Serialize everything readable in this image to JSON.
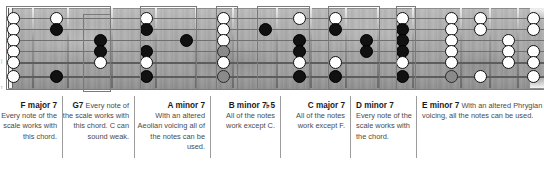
{
  "diagram": {
    "instrument": "6-string guitar neck",
    "string_count": 6,
    "colors": {
      "dot_black": "#111111",
      "dot_white": "#ffffff",
      "dot_gray": "#8a8a8a",
      "box_stroke": "#7a7a7a",
      "caption_text": "#4a4a4a",
      "chord_label": "#1a1a1a",
      "fretboard": "#a8a8a8"
    }
  },
  "fretboard": {
    "strings": [
      {
        "index": 1,
        "name": "high-e-string"
      },
      {
        "index": 2,
        "name": "b-string"
      },
      {
        "index": 3,
        "name": "g-string"
      },
      {
        "index": 4,
        "name": "d-string"
      },
      {
        "index": 5,
        "name": "a-string"
      },
      {
        "index": 6,
        "name": "low-e-string"
      }
    ],
    "open_string_markers": 6,
    "notes": [
      {
        "x": 13,
        "string": 1,
        "fill": "white"
      },
      {
        "x": 13,
        "string": 2,
        "fill": "white"
      },
      {
        "x": 13,
        "string": 3,
        "fill": "white"
      },
      {
        "x": 13,
        "string": 4,
        "fill": "white"
      },
      {
        "x": 13,
        "string": 5,
        "fill": "white"
      },
      {
        "x": 13,
        "string": 6,
        "fill": "white"
      },
      {
        "x": 56,
        "string": 1,
        "fill": "white"
      },
      {
        "x": 56,
        "string": 2,
        "fill": "black"
      },
      {
        "x": 56,
        "string": 6,
        "fill": "black"
      },
      {
        "x": 100,
        "string": 3,
        "fill": "black"
      },
      {
        "x": 100,
        "string": 4,
        "fill": "black"
      },
      {
        "x": 100,
        "string": 5,
        "fill": "white"
      },
      {
        "x": 146,
        "string": 1,
        "fill": "white"
      },
      {
        "x": 146,
        "string": 2,
        "fill": "black"
      },
      {
        "x": 146,
        "string": 4,
        "fill": "black"
      },
      {
        "x": 146,
        "string": 5,
        "fill": "white"
      },
      {
        "x": 146,
        "string": 6,
        "fill": "black"
      },
      {
        "x": 186,
        "string": 3,
        "fill": "black"
      },
      {
        "x": 223,
        "string": 1,
        "fill": "white"
      },
      {
        "x": 223,
        "string": 2,
        "fill": "white"
      },
      {
        "x": 223,
        "string": 3,
        "fill": "white"
      },
      {
        "x": 223,
        "string": 4,
        "fill": "gray"
      },
      {
        "x": 223,
        "string": 5,
        "fill": "white"
      },
      {
        "x": 223,
        "string": 6,
        "fill": "gray"
      },
      {
        "x": 265,
        "string": 2,
        "fill": "black"
      },
      {
        "x": 299,
        "string": 1,
        "fill": "white"
      },
      {
        "x": 299,
        "string": 3,
        "fill": "black"
      },
      {
        "x": 299,
        "string": 4,
        "fill": "black"
      },
      {
        "x": 299,
        "string": 5,
        "fill": "white"
      },
      {
        "x": 299,
        "string": 6,
        "fill": "black"
      },
      {
        "x": 335,
        "string": 1,
        "fill": "white"
      },
      {
        "x": 335,
        "string": 2,
        "fill": "black"
      },
      {
        "x": 335,
        "string": 5,
        "fill": "white"
      },
      {
        "x": 335,
        "string": 6,
        "fill": "black"
      },
      {
        "x": 366,
        "string": 3,
        "fill": "black"
      },
      {
        "x": 366,
        "string": 4,
        "fill": "black"
      },
      {
        "x": 402,
        "string": 1,
        "fill": "white"
      },
      {
        "x": 402,
        "string": 2,
        "fill": "black"
      },
      {
        "x": 402,
        "string": 3,
        "fill": "black"
      },
      {
        "x": 402,
        "string": 4,
        "fill": "black"
      },
      {
        "x": 402,
        "string": 5,
        "fill": "white"
      },
      {
        "x": 402,
        "string": 6,
        "fill": "black"
      },
      {
        "x": 451,
        "string": 1,
        "fill": "white"
      },
      {
        "x": 451,
        "string": 2,
        "fill": "white"
      },
      {
        "x": 451,
        "string": 3,
        "fill": "white"
      },
      {
        "x": 451,
        "string": 4,
        "fill": "white"
      },
      {
        "x": 451,
        "string": 5,
        "fill": "white"
      },
      {
        "x": 451,
        "string": 6,
        "fill": "gray"
      },
      {
        "x": 480,
        "string": 1,
        "fill": "white"
      },
      {
        "x": 480,
        "string": 2,
        "fill": "white"
      },
      {
        "x": 480,
        "string": 6,
        "fill": "white"
      },
      {
        "x": 508,
        "string": 3,
        "fill": "white"
      },
      {
        "x": 508,
        "string": 4,
        "fill": "white"
      },
      {
        "x": 508,
        "string": 5,
        "fill": "white"
      },
      {
        "x": 533,
        "string": 1,
        "fill": "white"
      },
      {
        "x": 533,
        "string": 2,
        "fill": "white"
      },
      {
        "x": 533,
        "string": 4,
        "fill": "white"
      },
      {
        "x": 533,
        "string": 5,
        "fill": "white"
      },
      {
        "x": 533,
        "string": 6,
        "fill": "white"
      }
    ],
    "frets": [
      8,
      32,
      67,
      111,
      155,
      195,
      232,
      276,
      310,
      345,
      377,
      412,
      460,
      489,
      517
    ],
    "voicing_boxes": [
      {
        "label": "F major 7",
        "left": 6,
        "top": 6,
        "width": 105,
        "height": 84
      },
      {
        "label": "G7",
        "left": 83,
        "top": 14,
        "width": 28,
        "height": 78
      },
      {
        "label": "A minor 7",
        "left": 140,
        "top": 6,
        "width": 57,
        "height": 84
      },
      {
        "label": "B minor 7b5",
        "left": 216,
        "top": 6,
        "width": 22,
        "height": 84
      },
      {
        "label": "C major 7",
        "left": 257,
        "top": 6,
        "width": 53,
        "height": 84
      },
      {
        "label": "D minor 7",
        "left": 328,
        "top": 6,
        "width": 52,
        "height": 84
      },
      {
        "label": "E minor 7",
        "left": 396,
        "top": 6,
        "width": 20,
        "height": 84
      }
    ]
  },
  "captions": [
    {
      "id": "f-major-7",
      "chord": "F major 7",
      "text": "Every note of the scale works with this chord.",
      "align": "right",
      "left": 0,
      "width": 62,
      "inline_chord": false
    },
    {
      "id": "g7",
      "chord": "G7",
      "text": "Every note of the scale works with this chord. C can sound weak.",
      "align": "right",
      "left": 62,
      "width": 72,
      "inline_chord": true
    },
    {
      "id": "a-minor-7",
      "chord": "A minor 7",
      "text": "With an altered Aeolian voicing all of the notes can be used.",
      "align": "right",
      "left": 134,
      "width": 76,
      "inline_chord": false
    },
    {
      "id": "b-minor-7-flat-5",
      "chord": "B minor 7♭5",
      "text": "All of the notes work except C.",
      "align": "right",
      "left": 210,
      "width": 70,
      "inline_chord": false
    },
    {
      "id": "c-major-7",
      "chord": "C major 7",
      "text": "All of the notes work except F.",
      "align": "right",
      "left": 280,
      "width": 70,
      "inline_chord": false
    },
    {
      "id": "d-minor-7",
      "chord": "D minor 7",
      "text": "Every note of the scale works with the chord.",
      "align": "left",
      "left": 350,
      "width": 66,
      "inline_chord": false
    },
    {
      "id": "e-minor-7",
      "chord": "E minor 7",
      "text": "With an altered Phrygian voicing, all the notes can be used.",
      "align": "left",
      "left": 416,
      "width": 128,
      "inline_chord": true
    }
  ]
}
